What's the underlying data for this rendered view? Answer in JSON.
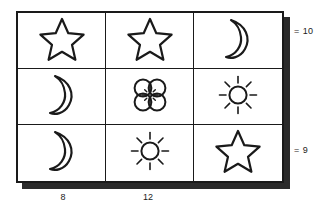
{
  "puzzle": {
    "title": "symbol-sum-grid",
    "ink_color": "#1a1a1a",
    "shadow_color": "#2b2b2b",
    "background_color": "#ffffff",
    "rows": 3,
    "columns": 3,
    "cells": [
      {
        "row": 0,
        "col": 0,
        "symbol": "star",
        "icon_name": "star-icon"
      },
      {
        "row": 0,
        "col": 1,
        "symbol": "star",
        "icon_name": "star-icon"
      },
      {
        "row": 0,
        "col": 2,
        "symbol": "moon",
        "icon_name": "crescent-moon-icon"
      },
      {
        "row": 1,
        "col": 0,
        "symbol": "moon",
        "icon_name": "crescent-moon-icon"
      },
      {
        "row": 1,
        "col": 1,
        "symbol": "flower",
        "icon_name": "flower-icon"
      },
      {
        "row": 1,
        "col": 2,
        "symbol": "sun",
        "icon_name": "sun-icon"
      },
      {
        "row": 2,
        "col": 0,
        "symbol": "moon",
        "icon_name": "crescent-moon-icon"
      },
      {
        "row": 2,
        "col": 1,
        "symbol": "sun",
        "icon_name": "sun-icon"
      },
      {
        "row": 2,
        "col": 2,
        "symbol": "star",
        "icon_name": "star-icon"
      }
    ],
    "row_sums": [
      {
        "row": 0,
        "equals": "=",
        "value": "10"
      },
      {
        "row": 2,
        "equals": "=",
        "value": "9"
      }
    ],
    "column_sums": [
      {
        "col": 0,
        "value": "8"
      },
      {
        "col": 1,
        "value": "12"
      },
      {
        "col": 2,
        "value": ""
      }
    ]
  }
}
